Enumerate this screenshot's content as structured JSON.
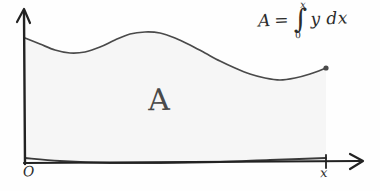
{
  "figure": {
    "kind": "hand-drawn-sketch",
    "title_text": "",
    "background_color": "#fefefe",
    "ink_color": "#3a3a3a",
    "hatch_color": "#b9b9b9",
    "area_label_color": "#4a4a4a"
  },
  "labels": {
    "origin": "O",
    "x_axis": "x",
    "area": "A"
  },
  "formula": {
    "lhs": "A",
    "equals": "=",
    "integral_sign": "∫",
    "upper_limit": "x",
    "lower_limit": "0",
    "integrand": "y dx",
    "full_text": "A = ∫0ˣ y dx"
  },
  "chart_data": {
    "type": "area",
    "title": "",
    "xlabel": "x",
    "ylabel": "",
    "grid": false,
    "legend": null,
    "annotations": [
      {
        "text": "A",
        "x": 160,
        "y": 100,
        "meaning": "shaded-area-under-curve"
      },
      {
        "text": "A = ∫0ˣ y dx",
        "x": 300,
        "y": 22,
        "meaning": "integral-formula"
      }
    ],
    "axes": {
      "x_axis_y_pixel": 163,
      "y_axis_x_pixel": 24,
      "x_tick_label": "x",
      "x_tick_pixel": 326,
      "origin_label": "O"
    },
    "upper_curve_points": [
      [
        25,
        38
      ],
      [
        40,
        44
      ],
      [
        55,
        50
      ],
      [
        70,
        53
      ],
      [
        85,
        52
      ],
      [
        100,
        47
      ],
      [
        115,
        40
      ],
      [
        130,
        34
      ],
      [
        145,
        32
      ],
      [
        160,
        33
      ],
      [
        175,
        38
      ],
      [
        190,
        45
      ],
      [
        205,
        53
      ],
      [
        220,
        61
      ],
      [
        235,
        68
      ],
      [
        250,
        74
      ],
      [
        265,
        78
      ],
      [
        280,
        80
      ],
      [
        295,
        78
      ],
      [
        310,
        74
      ],
      [
        326,
        68
      ]
    ],
    "lower_curve_points": [
      [
        25,
        158
      ],
      [
        60,
        161
      ],
      [
        110,
        163
      ],
      [
        160,
        163
      ],
      [
        220,
        162
      ],
      [
        270,
        160
      ],
      [
        326,
        158
      ]
    ],
    "endpoint_marker": {
      "x": 326,
      "y": 68,
      "shape": "dot"
    },
    "hatch": {
      "orientation": "vertical",
      "spacing_px": 7.5,
      "count": 40
    }
  }
}
